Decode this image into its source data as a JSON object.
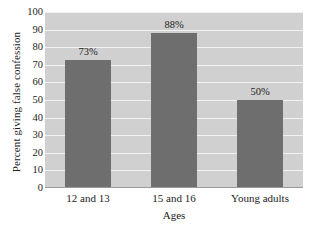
{
  "chart_data": {
    "type": "bar",
    "title": "",
    "categories": [
      "12 and 13",
      "15 and 16",
      "Young adults"
    ],
    "values": [
      73,
      88,
      50
    ],
    "data_labels": [
      "73%",
      "88%",
      "50%"
    ],
    "xlabel": "Ages",
    "ylabel": "Percent giving false confession",
    "ylim": [
      0,
      100
    ],
    "ytick_step": 10,
    "yticks": [
      0,
      10,
      20,
      30,
      40,
      50,
      60,
      70,
      80,
      90,
      100
    ],
    "ytick_labels": [
      "0",
      "10",
      "20",
      "30",
      "40",
      "50",
      "60",
      "70",
      "80",
      "90",
      "100"
    ],
    "grid": true,
    "legend": false,
    "colors": {
      "bar_fill": "#6e6e6e",
      "plot_background": "#d0d0d0",
      "gridline": "#f2f2f2",
      "axis_line": "#9a9a9a",
      "text": "#1c1c1c",
      "figure_background": "#ffffff"
    }
  }
}
